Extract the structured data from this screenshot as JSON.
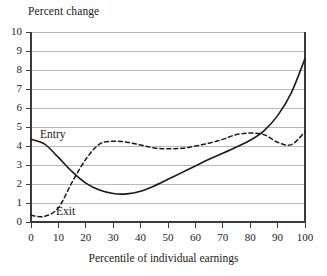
{
  "chart_data": {
    "type": "line",
    "title": "Percent change",
    "xlabel": "Percentile of individual earnings",
    "ylabel": "Percent change",
    "xlim": [
      0,
      100
    ],
    "ylim": [
      0,
      10
    ],
    "grid": "horizontal",
    "legend_position": "inline-annotations",
    "xticks": [
      "0",
      "10",
      "20",
      "30",
      "40",
      "50",
      "60",
      "70",
      "80",
      "90",
      "100"
    ],
    "yticks": [
      "0",
      "1",
      "2",
      "3",
      "4",
      "5",
      "6",
      "7",
      "8",
      "9",
      "10"
    ],
    "x": [
      0,
      5,
      10,
      15,
      20,
      25,
      30,
      35,
      40,
      45,
      50,
      55,
      60,
      65,
      70,
      75,
      80,
      85,
      90,
      95,
      100
    ],
    "series": [
      {
        "name": "Entry",
        "style": "solid",
        "color": "#1a1a1a",
        "values": [
          4.35,
          4.1,
          3.4,
          2.65,
          2.05,
          1.68,
          1.5,
          1.48,
          1.62,
          1.9,
          2.25,
          2.6,
          2.95,
          3.3,
          3.62,
          3.95,
          4.3,
          4.8,
          5.6,
          6.8,
          8.6
        ]
      },
      {
        "name": "Exit",
        "style": "dashed",
        "color": "#1a1a1a",
        "values": [
          0.35,
          0.3,
          0.75,
          2.1,
          3.3,
          4.1,
          4.25,
          4.2,
          4.05,
          3.9,
          3.85,
          3.88,
          4.0,
          4.15,
          4.35,
          4.6,
          4.68,
          4.6,
          4.2,
          4.07,
          4.75
        ]
      }
    ],
    "annotations": [
      {
        "text": "Entry",
        "x": 6,
        "y": 4.95
      },
      {
        "text": "Exit",
        "x": 15,
        "y": 0.9
      }
    ]
  }
}
